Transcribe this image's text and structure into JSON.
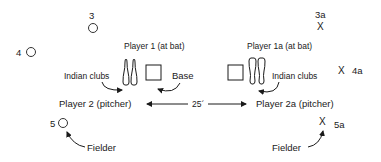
{
  "diagram": {
    "left_side": {
      "position_3": {
        "number": "3",
        "marker": "circle"
      },
      "position_4": {
        "number": "4",
        "marker": "circle"
      },
      "position_5": {
        "number": "5",
        "marker": "circle"
      },
      "batter_label": "Player 1 (at bat)",
      "clubs_label": "Indian clubs",
      "base_label": "Base",
      "pitcher_label": "Player 2 (pitcher)",
      "fielder_label": "Fielder"
    },
    "right_side": {
      "position_3a": {
        "number": "3a",
        "marker": "X"
      },
      "position_4a": {
        "number": "4a",
        "marker": "X"
      },
      "position_5a": {
        "number": "5a",
        "marker": "X"
      },
      "batter_label": "Player 1a (at bat)",
      "clubs_label": "Indian clubs",
      "pitcher_label": "Player 2a (pitcher)",
      "fielder_label": "Fielder"
    },
    "distance_label": "25´",
    "colors": {
      "ink": "#1a1a1a",
      "background": "#ffffff"
    }
  }
}
